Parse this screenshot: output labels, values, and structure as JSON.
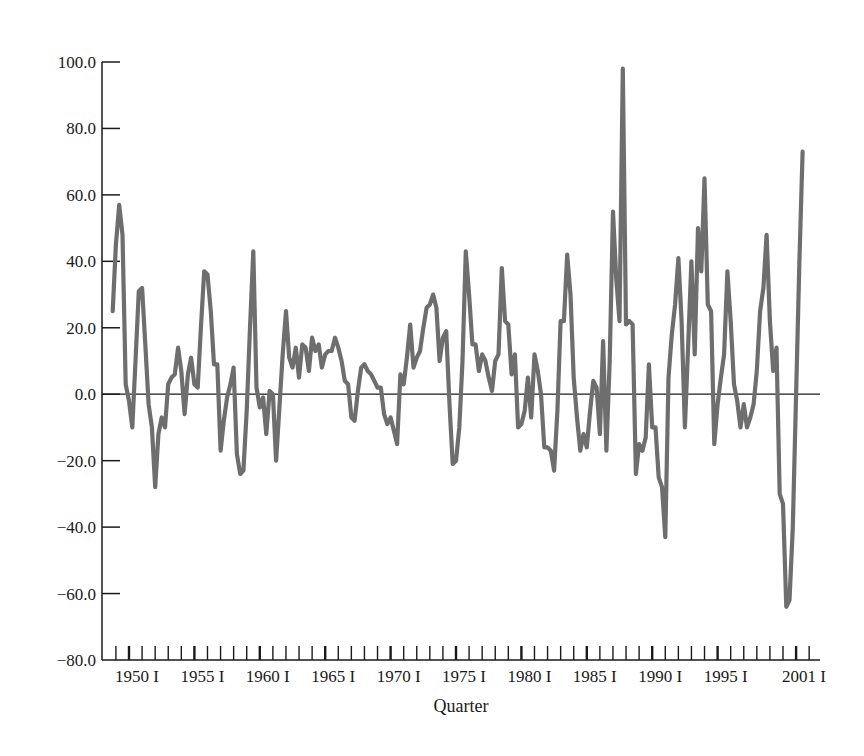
{
  "chart_data": {
    "type": "line",
    "title": "",
    "xlabel": "Quarter",
    "ylabel": "",
    "ylim": [
      -80,
      100
    ],
    "yticks": [
      100.0,
      80.0,
      60.0,
      40.0,
      20.0,
      0.0,
      -20.0,
      -40.0,
      -60.0,
      -80.0
    ],
    "ytick_labels": [
      "100.0",
      "80.0",
      "60.0",
      "40.0",
      "20.0",
      "0.0",
      "−20.0",
      "−40.0",
      "−60.0",
      "−80.0"
    ],
    "xtick_labels": [
      "1950 I",
      "1955 I",
      "1960 I",
      "1965 I",
      "1970 I",
      "1975 I",
      "1980 I",
      "1985 I",
      "1990 I",
      "1995 I",
      "2001 I"
    ],
    "xtick_years": [
      1950,
      1955,
      1960,
      1965,
      1970,
      1975,
      1980,
      1985,
      1990,
      1995,
      2001
    ],
    "x_start": 1948.75,
    "x_end": 2003.25,
    "grid": false,
    "legend": null,
    "zero_line": true,
    "series": [
      {
        "name": "series",
        "color": "#6e6e6e",
        "points": [
          [
            1948.75,
            25
          ],
          [
            1949.0,
            45
          ],
          [
            1949.25,
            57
          ],
          [
            1949.5,
            48
          ],
          [
            1949.75,
            3
          ],
          [
            1950.0,
            -2
          ],
          [
            1950.25,
            -10
          ],
          [
            1950.5,
            10
          ],
          [
            1950.75,
            31
          ],
          [
            1951.0,
            32
          ],
          [
            1951.25,
            15
          ],
          [
            1951.5,
            -3
          ],
          [
            1951.75,
            -10
          ],
          [
            1952.0,
            -28
          ],
          [
            1952.25,
            -12
          ],
          [
            1952.5,
            -7
          ],
          [
            1952.75,
            -10
          ],
          [
            1953.0,
            3
          ],
          [
            1953.25,
            5
          ],
          [
            1953.5,
            6
          ],
          [
            1953.75,
            14
          ],
          [
            1954.0,
            7
          ],
          [
            1954.25,
            -6
          ],
          [
            1954.5,
            6
          ],
          [
            1954.75,
            11
          ],
          [
            1955.0,
            3
          ],
          [
            1955.25,
            2
          ],
          [
            1955.5,
            20
          ],
          [
            1955.75,
            37
          ],
          [
            1956.0,
            36
          ],
          [
            1956.25,
            25
          ],
          [
            1956.5,
            9
          ],
          [
            1956.75,
            9
          ],
          [
            1957.0,
            -17
          ],
          [
            1957.25,
            -8
          ],
          [
            1957.5,
            -1
          ],
          [
            1957.75,
            3
          ],
          [
            1958.0,
            8
          ],
          [
            1958.25,
            -18
          ],
          [
            1958.5,
            -24
          ],
          [
            1958.75,
            -23
          ],
          [
            1959.0,
            -5
          ],
          [
            1959.25,
            20
          ],
          [
            1959.5,
            43
          ],
          [
            1959.75,
            2
          ],
          [
            1960.0,
            -4
          ],
          [
            1960.25,
            -1
          ],
          [
            1960.5,
            -12
          ],
          [
            1960.75,
            1
          ],
          [
            1961.0,
            0
          ],
          [
            1961.25,
            -20
          ],
          [
            1961.5,
            -4
          ],
          [
            1961.75,
            12
          ],
          [
            1962.0,
            25
          ],
          [
            1962.25,
            11
          ],
          [
            1962.5,
            8
          ],
          [
            1962.75,
            14
          ],
          [
            1963.0,
            5
          ],
          [
            1963.25,
            15
          ],
          [
            1963.5,
            14
          ],
          [
            1963.75,
            7
          ],
          [
            1964.0,
            17
          ],
          [
            1964.25,
            13
          ],
          [
            1964.5,
            15
          ],
          [
            1964.75,
            8
          ],
          [
            1965.0,
            12
          ],
          [
            1965.25,
            13
          ],
          [
            1965.5,
            13
          ],
          [
            1965.75,
            17
          ],
          [
            1966.0,
            14
          ],
          [
            1966.25,
            10
          ],
          [
            1966.5,
            4
          ],
          [
            1966.75,
            3
          ],
          [
            1967.0,
            -7
          ],
          [
            1967.25,
            -8
          ],
          [
            1967.5,
            1
          ],
          [
            1967.75,
            8
          ],
          [
            1968.0,
            9
          ],
          [
            1968.25,
            7
          ],
          [
            1968.5,
            6
          ],
          [
            1968.75,
            4
          ],
          [
            1969.0,
            2
          ],
          [
            1969.25,
            2
          ],
          [
            1969.5,
            -6
          ],
          [
            1969.75,
            -9
          ],
          [
            1970.0,
            -7
          ],
          [
            1970.25,
            -11
          ],
          [
            1970.5,
            -15
          ],
          [
            1970.75,
            6
          ],
          [
            1971.0,
            3
          ],
          [
            1971.25,
            11
          ],
          [
            1971.5,
            21
          ],
          [
            1971.75,
            8
          ],
          [
            1972.0,
            11
          ],
          [
            1972.25,
            13
          ],
          [
            1972.5,
            20
          ],
          [
            1972.75,
            26
          ],
          [
            1973.0,
            27
          ],
          [
            1973.25,
            30
          ],
          [
            1973.5,
            26
          ],
          [
            1973.75,
            10
          ],
          [
            1974.0,
            17
          ],
          [
            1974.25,
            19
          ],
          [
            1974.5,
            -3
          ],
          [
            1974.75,
            -21
          ],
          [
            1975.0,
            -20
          ],
          [
            1975.25,
            -10
          ],
          [
            1975.5,
            10
          ],
          [
            1975.75,
            43
          ],
          [
            1976.0,
            30
          ],
          [
            1976.25,
            15
          ],
          [
            1976.5,
            15
          ],
          [
            1976.75,
            7
          ],
          [
            1977.0,
            12
          ],
          [
            1977.25,
            10
          ],
          [
            1977.5,
            5
          ],
          [
            1977.75,
            1
          ],
          [
            1978.0,
            10
          ],
          [
            1978.25,
            12
          ],
          [
            1978.5,
            38
          ],
          [
            1978.75,
            22
          ],
          [
            1979.0,
            21
          ],
          [
            1979.25,
            6
          ],
          [
            1979.5,
            12
          ],
          [
            1979.75,
            -10
          ],
          [
            1980.0,
            -9
          ],
          [
            1980.25,
            -5
          ],
          [
            1980.5,
            5
          ],
          [
            1980.75,
            -7
          ],
          [
            1981.0,
            12
          ],
          [
            1981.25,
            7
          ],
          [
            1981.5,
            0
          ],
          [
            1981.75,
            -16
          ],
          [
            1982.0,
            -16
          ],
          [
            1982.25,
            -17
          ],
          [
            1982.5,
            -23
          ],
          [
            1982.75,
            -5
          ],
          [
            1983.0,
            22
          ],
          [
            1983.25,
            22
          ],
          [
            1983.5,
            42
          ],
          [
            1983.75,
            30
          ],
          [
            1984.0,
            5
          ],
          [
            1984.25,
            -7
          ],
          [
            1984.5,
            -17
          ],
          [
            1984.75,
            -12
          ],
          [
            1985.0,
            -16
          ],
          [
            1985.25,
            -5
          ],
          [
            1985.5,
            4
          ],
          [
            1985.75,
            2
          ],
          [
            1986.0,
            -12
          ],
          [
            1986.25,
            16
          ],
          [
            1986.5,
            -17
          ],
          [
            1986.75,
            10
          ],
          [
            1987.0,
            55
          ],
          [
            1987.25,
            35
          ],
          [
            1987.5,
            22
          ],
          [
            1987.75,
            98
          ],
          [
            1988.0,
            21
          ],
          [
            1988.25,
            22
          ],
          [
            1988.5,
            21
          ],
          [
            1988.75,
            -24
          ],
          [
            1989.0,
            -15
          ],
          [
            1989.25,
            -17
          ],
          [
            1989.5,
            -13
          ],
          [
            1989.75,
            9
          ],
          [
            1990.0,
            -10
          ],
          [
            1990.25,
            -10
          ],
          [
            1990.5,
            -25
          ],
          [
            1990.75,
            -28
          ],
          [
            1991.0,
            -43
          ],
          [
            1991.25,
            5
          ],
          [
            1991.5,
            18
          ],
          [
            1991.75,
            27
          ],
          [
            1992.0,
            41
          ],
          [
            1992.25,
            22
          ],
          [
            1992.5,
            -10
          ],
          [
            1992.75,
            15
          ],
          [
            1993.0,
            40
          ],
          [
            1993.25,
            12
          ],
          [
            1993.5,
            50
          ],
          [
            1993.75,
            37
          ],
          [
            1994.0,
            65
          ],
          [
            1994.25,
            27
          ],
          [
            1994.5,
            25
          ],
          [
            1994.75,
            -15
          ],
          [
            1995.0,
            -3
          ],
          [
            1995.25,
            5
          ],
          [
            1995.5,
            12
          ],
          [
            1995.75,
            37
          ],
          [
            1996.0,
            22
          ],
          [
            1996.25,
            3
          ],
          [
            1996.5,
            -2
          ],
          [
            1996.75,
            -10
          ],
          [
            1997.0,
            -3
          ],
          [
            1997.25,
            -10
          ],
          [
            1997.5,
            -7
          ],
          [
            1997.75,
            -3
          ],
          [
            1998.0,
            7
          ],
          [
            1998.25,
            25
          ],
          [
            1998.5,
            32
          ],
          [
            1998.75,
            48
          ],
          [
            1999.0,
            22
          ],
          [
            1999.25,
            7
          ],
          [
            1999.5,
            14
          ],
          [
            1999.75,
            -30
          ],
          [
            2000.0,
            -33
          ],
          [
            2000.25,
            -64
          ],
          [
            2000.5,
            -62
          ],
          [
            2000.75,
            -40
          ],
          [
            2001.0,
            0
          ],
          [
            2001.25,
            40
          ],
          [
            2001.5,
            73
          ]
        ]
      }
    ]
  },
  "axes": {
    "x_title": "Quarter",
    "y_labels": [
      "100.0",
      "80.0",
      "60.0",
      "40.0",
      "20.0",
      "0.0",
      "−20.0",
      "−40.0",
      "−60.0",
      "−80.0"
    ],
    "x_labels": [
      "1950 I",
      "1955 I",
      "1960 I",
      "1965 I",
      "1970 I",
      "1975 I",
      "1980 I",
      "1985 I",
      "1990 I",
      "1995 I",
      "2001 I"
    ]
  },
  "style": {
    "line_color": "#6e6e6e",
    "axis_color": "#1a1a1a"
  },
  "note": "Quarterly values are hand-estimated from the screenshot (approximate visual reconstruction)."
}
